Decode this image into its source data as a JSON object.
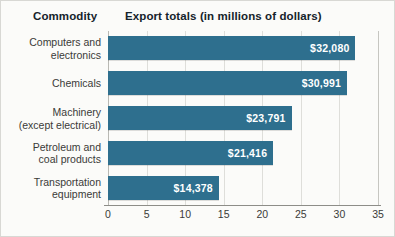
{
  "headers": {
    "commodity": "Commodity",
    "export_totals": "Export totals (in millions of dollars)"
  },
  "colors": {
    "bar": "#2e6f8e",
    "bar_label_text": "#ffffff",
    "gridline": "#dededa",
    "axis_line": "#8d8d88",
    "background": "#fbfbf9",
    "text": "#3a3a38",
    "heading_text": "#15232b"
  },
  "chart_data": {
    "type": "bar",
    "orientation": "horizontal",
    "title": "Export totals (in millions of dollars)",
    "xlabel": "",
    "ylabel": "Commodity",
    "xlim": [
      0,
      35
    ],
    "xticks": [
      0,
      5,
      10,
      15,
      20,
      25,
      30,
      35
    ],
    "xtick_labels": [
      "0",
      "5",
      "10",
      "15",
      "20",
      "25",
      "30",
      "35"
    ],
    "grid": true,
    "legend": "none",
    "units": "millions of dollars",
    "categories": [
      "Computers and electronics",
      "Chemicals",
      "Machinery (except electrical)",
      "Petroleum and coal products",
      "Transportation equipment"
    ],
    "category_lines": [
      [
        "Computers and",
        "electronics"
      ],
      [
        "Chemicals"
      ],
      [
        "Machinery",
        "(except electrical)"
      ],
      [
        "Petroleum and",
        "coal products"
      ],
      [
        "Transportation",
        "equipment"
      ]
    ],
    "values": [
      32.08,
      30.991,
      23.791,
      21.416,
      14.378
    ],
    "data_labels": [
      "$32,080",
      "$30,991",
      "$23,791",
      "$21,416",
      "$14,378"
    ]
  }
}
